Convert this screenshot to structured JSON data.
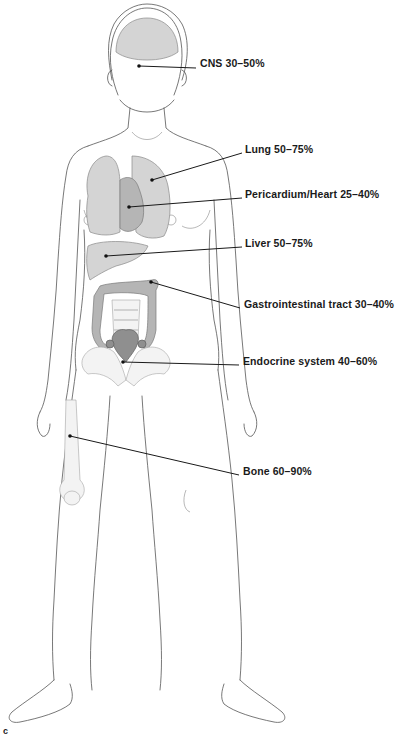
{
  "figure": {
    "panel_letter": "c",
    "labels": [
      {
        "id": "cns",
        "text": "CNS 30–50%",
        "x": 200,
        "y": 63,
        "anchor": [
          139,
          66
        ],
        "end": [
          196,
          68
        ]
      },
      {
        "id": "lung",
        "text": "Lung 50–75%",
        "x": 245,
        "y": 149,
        "anchor": [
          152,
          180
        ],
        "end": [
          242,
          153
        ]
      },
      {
        "id": "heart",
        "text": "Pericardium/Heart 25–40%",
        "x": 245,
        "y": 194,
        "anchor": [
          129,
          207
        ],
        "end": [
          242,
          198
        ]
      },
      {
        "id": "liver",
        "text": "Liver 50–75%",
        "x": 245,
        "y": 243,
        "anchor": [
          106,
          256
        ],
        "end": [
          242,
          247
        ]
      },
      {
        "id": "gi",
        "text": "Gastrointestinal tract 30–40%",
        "x": 244,
        "y": 304,
        "anchor": [
          151,
          282
        ],
        "end": [
          240,
          308
        ]
      },
      {
        "id": "endocrine",
        "text": "Endocrine system 40–60%",
        "x": 243,
        "y": 361,
        "anchor": [
          123,
          362
        ],
        "end": [
          239,
          365
        ]
      },
      {
        "id": "bone",
        "text": "Bone 60–90%",
        "x": 243,
        "y": 471,
        "anchor": [
          70,
          436
        ],
        "end": [
          239,
          475
        ]
      }
    ]
  }
}
